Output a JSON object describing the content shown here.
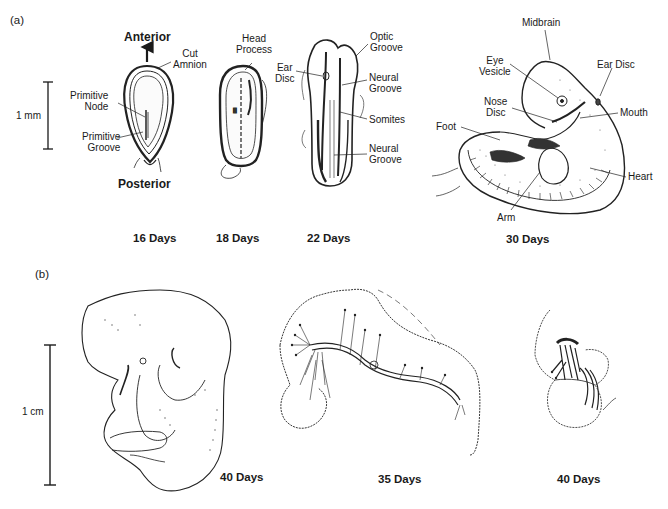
{
  "figure": {
    "panel_a": {
      "label": "(a)",
      "scale_bar": {
        "label": "1 mm"
      },
      "stages": [
        {
          "day_label": "16 Days",
          "direction_top": "Anterior",
          "direction_bottom": "Posterior",
          "annotations": [
            "Cut Amnion",
            "Primitive Node",
            "Primitive Groove"
          ]
        },
        {
          "day_label": "18 Days",
          "annotations": [
            "Head Process"
          ]
        },
        {
          "day_label": "22 Days",
          "annotations": [
            "Optic Groove",
            "Ear Disc",
            "Neural Groove",
            "Somites",
            "Neural Groove"
          ]
        },
        {
          "day_label": "30 Days",
          "annotations": [
            "Midbrain",
            "Eye Vesicle",
            "Ear Disc",
            "Nose Disc",
            "Mouth",
            "Foot",
            "Heart",
            "Arm"
          ]
        }
      ]
    },
    "panel_b": {
      "label": "(b)",
      "scale_bar": {
        "label": "1 cm"
      },
      "stages": [
        {
          "day_label": "40 Days"
        },
        {
          "day_label": "35 Days"
        },
        {
          "day_label": "40 Days"
        }
      ]
    }
  },
  "labels": {
    "cut_amnion_1": "Cut",
    "cut_amnion_2": "Amnion",
    "prim_node_1": "Primitive",
    "prim_node_2": "Node",
    "prim_groove_1": "Primitive",
    "prim_groove_2": "Groove",
    "head_process_1": "Head",
    "head_process_2": "Process",
    "optic_groove_1": "Optic",
    "optic_groove_2": "Groove",
    "ear_disc22_1": "Ear",
    "ear_disc22_2": "Disc",
    "neural_groove_a_1": "Neural",
    "neural_groove_a_2": "Groove",
    "somites": "Somites",
    "neural_groove_b_1": "Neural",
    "neural_groove_b_2": "Groove",
    "midbrain": "Midbrain",
    "eye_vesicle_1": "Eye",
    "eye_vesicle_2": "Vesicle",
    "ear_disc30": "Ear Disc",
    "nose_disc_1": "Nose",
    "nose_disc_2": "Disc",
    "mouth": "Mouth",
    "foot": "Foot",
    "heart": "Heart",
    "arm": "Arm"
  }
}
